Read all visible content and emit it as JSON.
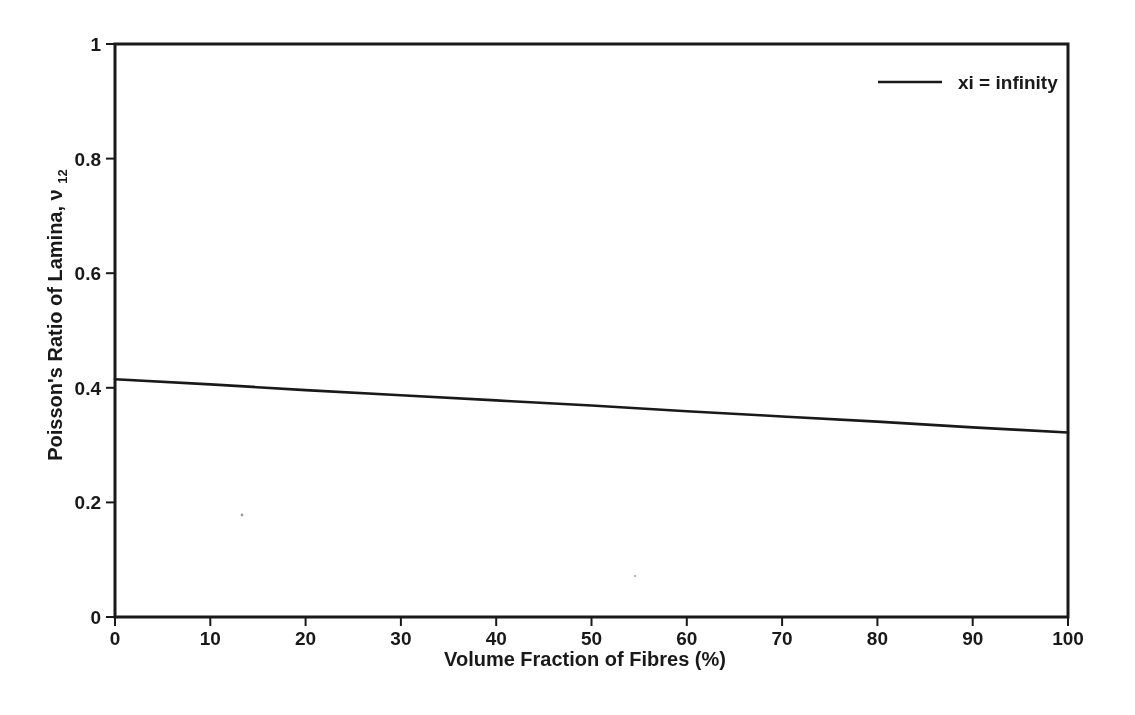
{
  "figure": {
    "background": "#ffffff",
    "ink": "#1b1b1b"
  },
  "chart_data": {
    "type": "line",
    "title": "",
    "xlabel": "Volume Fraction of Fibres (%)",
    "ylabel": "Poisson's Ratio of Lamina, ν12",
    "ylabel_parts": {
      "prefix": "Poisson's Ratio of Lamina, ",
      "symbol": "ν",
      "subscript": "12"
    },
    "xlim": [
      0,
      100
    ],
    "ylim": [
      0,
      1
    ],
    "xticks": [
      0,
      10,
      20,
      30,
      40,
      50,
      60,
      70,
      80,
      90,
      100
    ],
    "xtick_labels": [
      "0",
      "10",
      "20",
      "30",
      "40",
      "50",
      "60",
      "70",
      "80",
      "90",
      "100"
    ],
    "yticks": [
      0,
      0.2,
      0.4,
      0.6,
      0.8,
      1
    ],
    "ytick_labels": [
      "0",
      "0.2",
      "0.4",
      "0.6",
      "0.8",
      "1"
    ],
    "grid": false,
    "frame": "full-box",
    "legend": {
      "position": "top-right",
      "entries": [
        {
          "label": "xi = infinity",
          "color": "#1b1b1b",
          "style": "solid"
        }
      ]
    },
    "series": [
      {
        "name": "xi = infinity",
        "color": "#1b1b1b",
        "x": [
          0,
          10,
          20,
          30,
          40,
          50,
          60,
          70,
          80,
          90,
          100
        ],
        "values": [
          0.415,
          0.406,
          0.396,
          0.387,
          0.378,
          0.369,
          0.359,
          0.35,
          0.341,
          0.331,
          0.322
        ]
      }
    ]
  }
}
